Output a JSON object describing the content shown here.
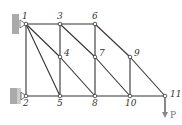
{
  "diagram": {
    "type": "truss",
    "nodes": [
      {
        "id": "1",
        "x": 26,
        "y": 24,
        "label": "1"
      },
      {
        "id": "2",
        "x": 26,
        "y": 96,
        "label": "2"
      },
      {
        "id": "3",
        "x": 60,
        "y": 24,
        "label": "3"
      },
      {
        "id": "4",
        "x": 60,
        "y": 57,
        "label": "4"
      },
      {
        "id": "5",
        "x": 60,
        "y": 96,
        "label": "5"
      },
      {
        "id": "6",
        "x": 95,
        "y": 24,
        "label": "6"
      },
      {
        "id": "7",
        "x": 95,
        "y": 57,
        "label": "7"
      },
      {
        "id": "8",
        "x": 95,
        "y": 96,
        "label": "8"
      },
      {
        "id": "9",
        "x": 130,
        "y": 57,
        "label": "9"
      },
      {
        "id": "10",
        "x": 130,
        "y": 96,
        "label": "10"
      },
      {
        "id": "11",
        "x": 165,
        "y": 96,
        "label": "11"
      }
    ],
    "members": [
      [
        "1",
        "3"
      ],
      [
        "3",
        "6"
      ],
      [
        "2",
        "5"
      ],
      [
        "5",
        "8"
      ],
      [
        "8",
        "10"
      ],
      [
        "10",
        "11"
      ],
      [
        "1",
        "2"
      ],
      [
        "3",
        "4"
      ],
      [
        "4",
        "5"
      ],
      [
        "6",
        "7"
      ],
      [
        "7",
        "8"
      ],
      [
        "9",
        "10"
      ],
      [
        "1",
        "4"
      ],
      [
        "4",
        "8"
      ],
      [
        "1",
        "5"
      ],
      [
        "3",
        "7"
      ],
      [
        "7",
        "10"
      ],
      [
        "6",
        "9"
      ],
      [
        "9",
        "11"
      ]
    ],
    "supports": [
      {
        "node": "1",
        "type": "pin-wall"
      },
      {
        "node": "2",
        "type": "roller-wall"
      }
    ],
    "load": {
      "node": "11",
      "label": "P",
      "direction": "down"
    },
    "colors": {
      "member": "#333333",
      "wall": "#aaaaaa",
      "load": "#888888"
    }
  }
}
